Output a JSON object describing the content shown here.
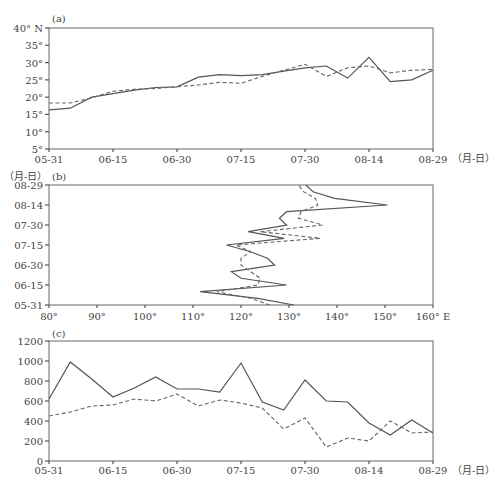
{
  "chart_data": [
    {
      "type": "line",
      "panel": "(a)",
      "title": "(a)",
      "xlabel": "（月-日）",
      "ylabel": "",
      "x_ticks": [
        "05-31",
        "06-15",
        "06-30",
        "07-15",
        "07-30",
        "08-14",
        "08-29"
      ],
      "y_ticks": [
        "5°",
        "10°",
        "15°",
        "20°",
        "25°",
        "30°",
        "35°",
        "40° N"
      ],
      "ylim": [
        5,
        40
      ],
      "x": [
        "05-31",
        "06-05",
        "06-10",
        "06-15",
        "06-20",
        "06-25",
        "06-30",
        "07-05",
        "07-10",
        "07-15",
        "07-20",
        "07-25",
        "07-30",
        "08-04",
        "08-09",
        "08-14",
        "08-19",
        "08-24",
        "08-29"
      ],
      "series": [
        {
          "name": "solid",
          "style": "solid",
          "values": [
            16.3,
            16.8,
            20.0,
            21.0,
            22.0,
            22.8,
            23.0,
            25.8,
            26.5,
            26.2,
            26.5,
            27.5,
            28.5,
            29.0,
            25.5,
            31.5,
            24.5,
            25.0,
            27.8
          ]
        },
        {
          "name": "dashed",
          "style": "dashed",
          "values": [
            18.3,
            18.3,
            19.8,
            21.7,
            22.3,
            22.5,
            23.0,
            23.5,
            24.3,
            24.0,
            26.0,
            27.8,
            29.5,
            26.0,
            28.5,
            29.0,
            27.0,
            27.8,
            28.0
          ]
        }
      ]
    },
    {
      "type": "line",
      "panel": "(b)",
      "title": "(b)",
      "orientation": "vertical-time",
      "xlabel": "",
      "ylabel": "（月-日）",
      "x_ticks": [
        "80°",
        "90°",
        "100°",
        "110°",
        "120°",
        "130°",
        "140°",
        "150°",
        "160° E"
      ],
      "y_ticks": [
        "05-31",
        "06-15",
        "06-30",
        "07-15",
        "07-30",
        "08-14",
        "08-29"
      ],
      "xlim": [
        80,
        160
      ],
      "y": [
        "05-31",
        "06-05",
        "06-10",
        "06-15",
        "06-20",
        "06-25",
        "06-30",
        "07-05",
        "07-10",
        "07-15",
        "07-20",
        "07-25",
        "07-30",
        "08-04",
        "08-09",
        "08-14",
        "08-19",
        "08-24",
        "08-29"
      ],
      "series": [
        {
          "name": "solid",
          "style": "solid",
          "values": [
            131.0,
            123.5,
            111.5,
            129.5,
            120.0,
            118.0,
            127.0,
            125.5,
            122.0,
            117.0,
            129.0,
            121.5,
            129.5,
            128.0,
            129.5,
            150.5,
            139.5,
            135.0,
            133.5
          ]
        },
        {
          "name": "dashed",
          "style": "dashed",
          "values": [
            126.0,
            122.0,
            115.0,
            123.5,
            124.0,
            122.0,
            120.0,
            120.0,
            122.0,
            119.0,
            136.5,
            124.0,
            137.0,
            132.0,
            132.5,
            136.0,
            135.5,
            133.0,
            132.0
          ]
        }
      ]
    },
    {
      "type": "line",
      "panel": "(c)",
      "title": "(c)",
      "xlabel": "（月-日）",
      "ylabel": "",
      "x_ticks": [
        "05-31",
        "06-15",
        "06-30",
        "07-15",
        "07-30",
        "08-14",
        "08-29"
      ],
      "y_ticks": [
        "0",
        "200",
        "400",
        "600",
        "800",
        "1000",
        "1200"
      ],
      "ylim": [
        0,
        1200
      ],
      "x": [
        "05-31",
        "06-05",
        "06-10",
        "06-15",
        "06-20",
        "06-25",
        "06-30",
        "07-05",
        "07-10",
        "07-15",
        "07-20",
        "07-25",
        "07-30",
        "08-04",
        "08-09",
        "08-14",
        "08-19",
        "08-24",
        "08-29"
      ],
      "series": [
        {
          "name": "solid",
          "style": "solid",
          "values": [
            620,
            990,
            820,
            640,
            730,
            840,
            720,
            720,
            690,
            980,
            590,
            510,
            810,
            600,
            590,
            380,
            260,
            410,
            280
          ]
        },
        {
          "name": "dashed",
          "style": "dashed",
          "values": [
            450,
            490,
            550,
            560,
            620,
            600,
            670,
            550,
            610,
            580,
            530,
            320,
            430,
            140,
            230,
            200,
            400,
            280,
            290
          ]
        }
      ]
    }
  ]
}
